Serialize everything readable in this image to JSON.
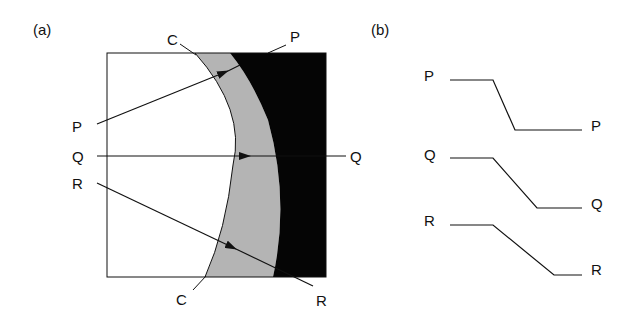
{
  "panel_a": {
    "label": "(a)",
    "curve_label_top": "C",
    "curve_label_bottom": "C",
    "rays": [
      {
        "name": "P",
        "left_label": "P",
        "right_label": "P"
      },
      {
        "name": "Q",
        "left_label": "Q",
        "right_label": "Q"
      },
      {
        "name": "R",
        "left_label": "R",
        "right_label": "R"
      }
    ],
    "colors": {
      "gray_region": "#b4b4b4",
      "black_region": "#050505",
      "stroke": "#111111"
    }
  },
  "panel_b": {
    "label": "(b)",
    "profiles": [
      {
        "name": "P",
        "left_label": "P",
        "right_label": "P"
      },
      {
        "name": "Q",
        "left_label": "Q",
        "right_label": "Q"
      },
      {
        "name": "R",
        "left_label": "R",
        "right_label": "R"
      }
    ]
  }
}
